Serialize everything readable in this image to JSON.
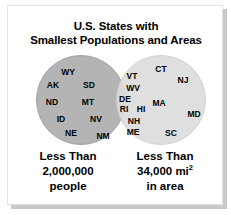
{
  "figure": {
    "title_line_1": "U.S. States with",
    "title_line_2": "Smallest Populations and Areas",
    "colors": {
      "circle_population_fill": "#b4b4b4",
      "circle_area_fill": "#dddddd",
      "frame_border": "#e3e3e3",
      "shadow": "#c9c9c9",
      "text": "#000000"
    }
  },
  "chart_data": {
    "type": "venn",
    "title": "U.S. States with Smallest Populations and Areas",
    "sets": [
      {
        "name": "Less Than 2,000,000 people",
        "caption_line_1": "Less Than",
        "caption_line_2": "2,000,000",
        "caption_line_3": "people",
        "fill": "#b4b4b4",
        "exclusive_members": [
          "WY",
          "AK",
          "SD",
          "ND",
          "MT",
          "ID",
          "NV",
          "NE",
          "NM"
        ],
        "exclusive_count": 9
      },
      {
        "name": "Less Than 34,000 mi2 in area",
        "caption_line_1": "Less Than",
        "caption_line_2_value": "34,000 mi",
        "caption_line_2_exponent": "2",
        "caption_line_3": "in area",
        "fill": "#dddddd",
        "exclusive_members": [
          "CT",
          "NJ",
          "MA",
          "MD",
          "SC"
        ],
        "exclusive_count": 5
      }
    ],
    "intersection": {
      "members": [
        "VT",
        "WV",
        "DE",
        "RI",
        "HI",
        "NH",
        "ME"
      ],
      "count": 7
    },
    "labels": {
      "left": [
        {
          "text": "WY",
          "x": 60,
          "y": 21
        },
        {
          "text": "AK",
          "x": 45,
          "y": 34
        },
        {
          "text": "SD",
          "x": 81,
          "y": 34
        },
        {
          "text": "ND",
          "x": 44,
          "y": 51
        },
        {
          "text": "MT",
          "x": 80,
          "y": 51
        },
        {
          "text": "ID",
          "x": 53,
          "y": 68
        },
        {
          "text": "NV",
          "x": 88,
          "y": 68
        },
        {
          "text": "NE",
          "x": 63,
          "y": 82
        },
        {
          "text": "NM",
          "x": 95,
          "y": 85
        }
      ],
      "overlap": [
        {
          "text": "VT",
          "x": 124,
          "y": 25
        },
        {
          "text": "WV",
          "x": 125,
          "y": 37
        },
        {
          "text": "DE",
          "x": 117,
          "y": 48
        },
        {
          "text": "RI",
          "x": 116,
          "y": 58
        },
        {
          "text": "HI",
          "x": 133,
          "y": 58
        },
        {
          "text": "NH",
          "x": 126,
          "y": 70
        },
        {
          "text": "ME",
          "x": 125,
          "y": 81
        }
      ],
      "right": [
        {
          "text": "CT",
          "x": 153,
          "y": 18
        },
        {
          "text": "NJ",
          "x": 175,
          "y": 29
        },
        {
          "text": "MA",
          "x": 151,
          "y": 52
        },
        {
          "text": "MD",
          "x": 186,
          "y": 63
        },
        {
          "text": "SC",
          "x": 163,
          "y": 82
        }
      ]
    }
  }
}
